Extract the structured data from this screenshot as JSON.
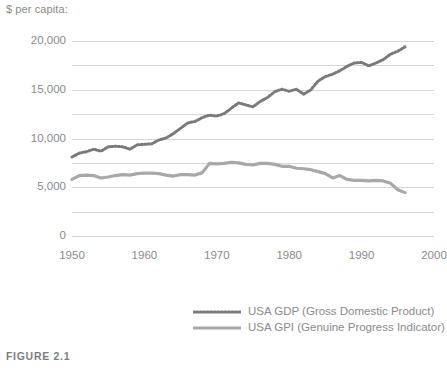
{
  "axis_unit_label": "$ per capita:",
  "caption": "FIGURE 2.1",
  "legend": {
    "items": [
      {
        "label": "USA GDP (Gross Domestic Product)",
        "style": "dotted",
        "color": "#7a7a7a",
        "swatch": "dotted-line-swatch"
      },
      {
        "label": "USA GPI (Genuine Progress Indicator)",
        "style": "solid",
        "color": "#a8a8a8",
        "swatch": "solid-line-swatch"
      }
    ]
  },
  "colors": {
    "gdp_line": "#7a7a7a",
    "gpi_line": "#a8a8a8",
    "gridline": "#d6d6d6",
    "text": "#8a8a8a",
    "background": "#ffffff"
  },
  "chart_data": {
    "type": "line",
    "title": "",
    "subtitle": "",
    "xlabel": "",
    "ylabel": "$ per capita:",
    "xlim": [
      1950,
      2000
    ],
    "ylim": [
      0,
      20000
    ],
    "grid": true,
    "legend_position": "bottom-right",
    "y_ticks": [
      0,
      5000,
      10000,
      15000,
      20000
    ],
    "y_tick_labels": [
      "0",
      "5,000",
      "10,000",
      "15,000",
      "20,000"
    ],
    "y_minor_ticks": [
      2500,
      7500,
      12500,
      17500
    ],
    "x_ticks": [
      1950,
      1960,
      1970,
      1980,
      1990,
      2000
    ],
    "x_tick_labels": [
      "1950",
      "1960",
      "1970",
      "1980",
      "1990",
      "2000"
    ],
    "x": [
      1950,
      1951,
      1952,
      1953,
      1954,
      1955,
      1956,
      1957,
      1958,
      1959,
      1960,
      1961,
      1962,
      1963,
      1964,
      1965,
      1966,
      1967,
      1968,
      1969,
      1970,
      1971,
      1972,
      1973,
      1974,
      1975,
      1976,
      1977,
      1978,
      1979,
      1980,
      1981,
      1982,
      1983,
      1984,
      1985,
      1986,
      1987,
      1988,
      1989,
      1990,
      1991,
      1992,
      1993,
      1994,
      1995,
      1996
    ],
    "series": [
      {
        "name": "USA GDP (Gross Domestic Product)",
        "style": "dotted",
        "color": "#7a7a7a",
        "values": [
          8100,
          8500,
          8650,
          8900,
          8700,
          9150,
          9200,
          9150,
          8900,
          9350,
          9400,
          9450,
          9850,
          10050,
          10500,
          11050,
          11600,
          11750,
          12150,
          12400,
          12300,
          12550,
          13100,
          13650,
          13450,
          13250,
          13800,
          14200,
          14800,
          15050,
          14850,
          15050,
          14550,
          15000,
          15900,
          16350,
          16600,
          16950,
          17400,
          17750,
          17800,
          17450,
          17750,
          18100,
          18650,
          18950,
          19400
        ]
      },
      {
        "name": "USA GPI (Genuine Progress Indicator)",
        "style": "solid",
        "color": "#a8a8a8",
        "values": [
          5800,
          6200,
          6250,
          6200,
          5950,
          6050,
          6200,
          6300,
          6250,
          6400,
          6450,
          6450,
          6400,
          6250,
          6150,
          6300,
          6300,
          6250,
          6500,
          7450,
          7400,
          7450,
          7550,
          7500,
          7350,
          7300,
          7450,
          7450,
          7350,
          7150,
          7150,
          6950,
          6900,
          6800,
          6600,
          6400,
          5950,
          6200,
          5800,
          5700,
          5700,
          5650,
          5700,
          5650,
          5400,
          4750,
          4450
        ]
      }
    ]
  }
}
